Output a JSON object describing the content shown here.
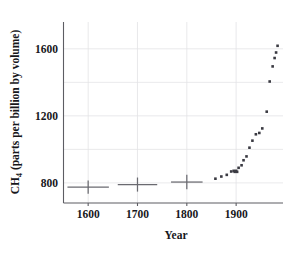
{
  "chart_data": {
    "type": "scatter",
    "title": "",
    "xlabel": "Year",
    "ylabel": "CH4 (parts per billion by volume)",
    "ylabel_main": "CH",
    "ylabel_sub": "4",
    "ylabel_rest": " (parts per billion by volume)",
    "xlim": [
      1550,
      1995
    ],
    "ylim": [
      680,
      1760
    ],
    "xticks": [
      1600,
      1700,
      1800,
      1900
    ],
    "xtick_labels": [
      "1600",
      "1700",
      "1800",
      "1900"
    ],
    "yticks": [
      800,
      1200,
      1600
    ],
    "ytick_labels": [
      "800",
      "1200",
      "1600"
    ],
    "gridlines_y": [
      800,
      1000,
      1200,
      1400,
      1600
    ],
    "gridlines_x": [
      1600,
      1700,
      1800,
      1900
    ],
    "grid": true,
    "legend": "none",
    "marker_color": "#3a3a42",
    "errorbar_color": "#6a6a70",
    "grid_color": "#e3e3e6",
    "axis_color": "#5d5d63",
    "series": [
      {
        "name": "Ice core (with uncertainty)",
        "type": "errorbar",
        "points": [
          {
            "x": 1600,
            "y": 775,
            "xerr": 42,
            "yerr": 40
          },
          {
            "x": 1700,
            "y": 790,
            "xerr": 40,
            "yerr": 42
          },
          {
            "x": 1800,
            "y": 805,
            "xerr": 32,
            "yerr": 43
          }
        ]
      },
      {
        "name": "Atmospheric CH4 record",
        "type": "scatter",
        "points": [
          {
            "x": 1858,
            "y": 825
          },
          {
            "x": 1870,
            "y": 838
          },
          {
            "x": 1881,
            "y": 848
          },
          {
            "x": 1890,
            "y": 868
          },
          {
            "x": 1895,
            "y": 872
          },
          {
            "x": 1897,
            "y": 866
          },
          {
            "x": 1900,
            "y": 872
          },
          {
            "x": 1902,
            "y": 866
          },
          {
            "x": 1905,
            "y": 890
          },
          {
            "x": 1911,
            "y": 905
          },
          {
            "x": 1915,
            "y": 935
          },
          {
            "x": 1921,
            "y": 958
          },
          {
            "x": 1927,
            "y": 1010
          },
          {
            "x": 1933,
            "y": 1052
          },
          {
            "x": 1940,
            "y": 1090
          },
          {
            "x": 1947,
            "y": 1098
          },
          {
            "x": 1953,
            "y": 1125
          },
          {
            "x": 1962,
            "y": 1225
          },
          {
            "x": 1968,
            "y": 1405
          },
          {
            "x": 1974,
            "y": 1495
          },
          {
            "x": 1978,
            "y": 1545
          },
          {
            "x": 1981,
            "y": 1578
          },
          {
            "x": 1984,
            "y": 1618
          }
        ]
      }
    ]
  }
}
